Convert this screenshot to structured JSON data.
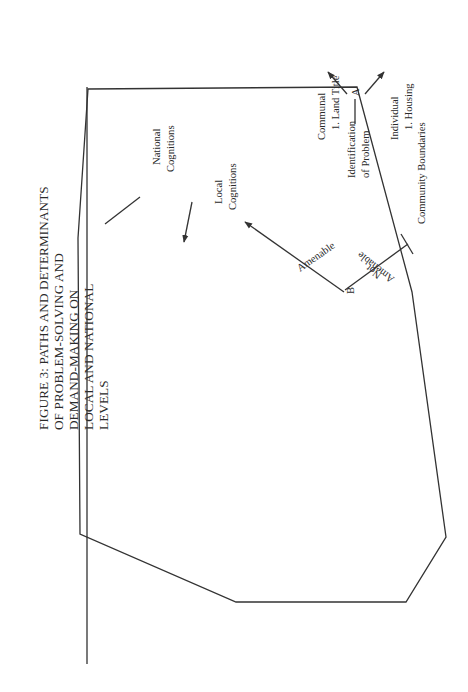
{
  "figure": {
    "title_lines": [
      "FIGURE 3: PATHS AND DETERMINANTS",
      "OF PROBLEM-SOLVING AND",
      "DEMAND-MAKING ON",
      "LOCAL AND NATIONAL",
      "LEVELS"
    ],
    "boundary_label": "Community Boundaries",
    "nodes": {
      "A": "A",
      "B": "B",
      "C": "C",
      "D": "D",
      "E": "E",
      "C1": "C",
      "C1_sub": "1",
      "C2": "C",
      "C2_sub": "2"
    },
    "labels": {
      "identification_1": "Identification",
      "identification_2": "of Problem",
      "communal": "Communal",
      "communal_1": "1. Land Title",
      "communal_2": "2. Infrastructure",
      "individual": "Individual",
      "individual_1": "1. Housing",
      "amenable": "Amenable",
      "not_amenable_1": "Not",
      "not_amenable_2": "Amenable",
      "local_cognitions_1": "Local",
      "local_cognitions_2": "Cognitions",
      "national_cognitions_1": "National",
      "national_cognitions_2": "Cognitions",
      "location_1": "Location of",
      "location_2": "Resources",
      "national": "National",
      "local": "Local",
      "ministry_1": "Ministry of Housing",
      "ministry_2": "Field Office",
      "previous_1": "Previous Contacts",
      "previous_2": "Seen as Successful",
      "local_leaders": "1. Local Leaders",
      "community_1": "2. Community",
      "community_2": "Inhabitants",
      "problem_solving": "Problem-Solving",
      "demand_1": "Demand-",
      "demand_2": "Making",
      "linkage_a": "a",
      "linkage_b": "b"
    },
    "caption_lines": [
      "Perception of an objective need–point A.",
      "Decision: individual need or communal need?",
      "If communal,",
      "Solution for the objective need–point B.",
      "Decision: is need amenable to solution or not?",
      "If amenable, judged on knowledge of local and/or national resources,",
      "Location of resources: local or national–point C.",
      "If local (including neighbors, local leaders, volunteer labor, etc.), problem-solving mode occurs–point D.",
      "If national (including Ministry of Housing, DPJ, ONDEPJOV), demanding-making mode occurs–point E.",
      "The choice of local or national will be influenced by previous contacts.",
      "If problem-solving (point D) is insufficient, demand-making may result (linkage a)."
    ]
  }
}
